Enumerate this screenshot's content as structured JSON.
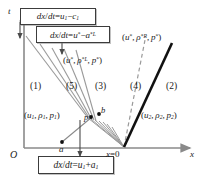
{
  "figure": {
    "type": "xt-riemann-wave-diagram",
    "axes": {
      "t_label": "t",
      "x_label": "x",
      "origin_label": "O",
      "x_origin_tick_label": "x=0",
      "point_a_label": "a",
      "point_b_label": "b",
      "point_p_label": "p"
    },
    "callouts": [
      {
        "name": "left-characteristic-speed",
        "text": "dx/dt=u1−c1",
        "parts": {
          "lhs": "dx/dt=",
          "u": "u",
          "usub": "1",
          "sign": "−",
          "c": "c",
          "csub": "1"
        }
      },
      {
        "name": "star-left-speed",
        "text": "dx/dt=u*−a*L",
        "parts": {
          "lhs": "dx/dt=",
          "u": "u",
          "usup": "*",
          "sign": "−",
          "a": "a",
          "asup": "*L"
        }
      },
      {
        "name": "right-characteristic-speed",
        "text": "dx/dt=u1+a1",
        "parts": {
          "lhs": "dx/dt=",
          "u": "u",
          "usub": "1",
          "sign": "+",
          "a": "a",
          "asub": "1"
        }
      }
    ],
    "state_labels": [
      {
        "name": "state-left",
        "text": "(u1, ρ1, p1)"
      },
      {
        "name": "state-star-left",
        "text": "(u*, ρ*L, p*)"
      },
      {
        "name": "state-star-right",
        "text": "(u*, ρ*R, p*)"
      },
      {
        "name": "state-right",
        "text": "(u2, ρ2, p2)"
      }
    ],
    "regions": [
      {
        "name": "region-1",
        "label": "(1)"
      },
      {
        "name": "region-5",
        "label": "(5)"
      },
      {
        "name": "region-3",
        "label": "(3)"
      },
      {
        "name": "region-4",
        "label": "(4)"
      },
      {
        "name": "region-2",
        "label": "(2)"
      }
    ],
    "colors": {
      "axis": "#8a8a8a",
      "fan": "#9a9a9a",
      "shock": "#111111",
      "contact_dashed": "#9a9a9a",
      "box_border": "#3c3c3c",
      "text": "#1a1a1a"
    }
  }
}
